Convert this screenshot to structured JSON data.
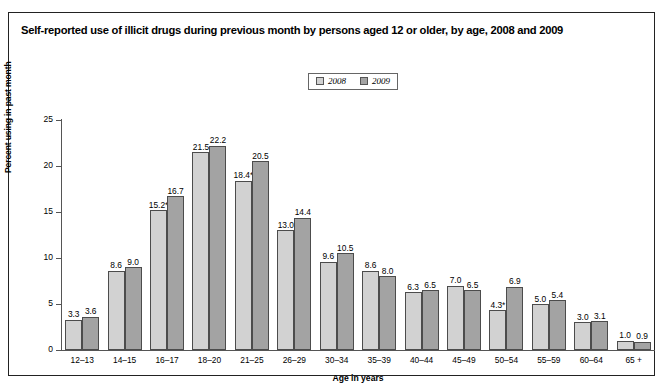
{
  "figure": {
    "title": "Self-reported use of illicit drugs during previous month by persons aged 12 or older, by age, 2008 and 2009"
  },
  "legend": {
    "position": "top-center",
    "entries": [
      {
        "label": "2008",
        "color": "#d2d2d2"
      },
      {
        "label": "2009",
        "color": "#a3a3a3"
      }
    ]
  },
  "chart_data": {
    "type": "bar",
    "title": "Self-reported use of illicit drugs during previous month by persons aged 12 or older, by age, 2008 and 2009",
    "xlabel": "Age in years",
    "ylabel": "Percent using in past month",
    "ylim": [
      0,
      25
    ],
    "yticks": [
      0,
      5,
      10,
      15,
      20,
      25
    ],
    "ytick_labels": [
      "0",
      "5",
      "10",
      "15",
      "20",
      "25"
    ],
    "grid": false,
    "legend_position": "top-center",
    "categories": [
      "12–13",
      "14–15",
      "16–17",
      "18–20",
      "21–25",
      "26–29",
      "30–34",
      "35–39",
      "40–44",
      "45–49",
      "50–54",
      "55–59",
      "60–64",
      "65 +"
    ],
    "series": [
      {
        "name": "2008",
        "color": "#d2d2d2",
        "values": [
          3.3,
          8.6,
          15.2,
          21.5,
          18.4,
          13.0,
          9.6,
          8.6,
          6.3,
          7.0,
          4.3,
          5.0,
          3.0,
          1.0
        ],
        "labels": [
          "3.3",
          "8.6",
          "15.2*",
          "21.5",
          "18.4*",
          "13.0",
          "9.6",
          "8.6",
          "6.3",
          "7.0",
          "4.3*",
          "5.0",
          "3.0",
          "1.0"
        ]
      },
      {
        "name": "2009",
        "color": "#a3a3a3",
        "values": [
          3.6,
          9.0,
          16.7,
          22.2,
          20.5,
          14.4,
          10.5,
          8.0,
          6.5,
          6.5,
          6.9,
          5.4,
          3.1,
          0.9
        ],
        "labels": [
          "3.6",
          "9.0",
          "16.7",
          "22.2",
          "20.5",
          "14.4",
          "10.5",
          "8.0",
          "6.5",
          "6.5",
          "6.9",
          "5.4",
          "3.1",
          "0.9"
        ]
      }
    ]
  }
}
